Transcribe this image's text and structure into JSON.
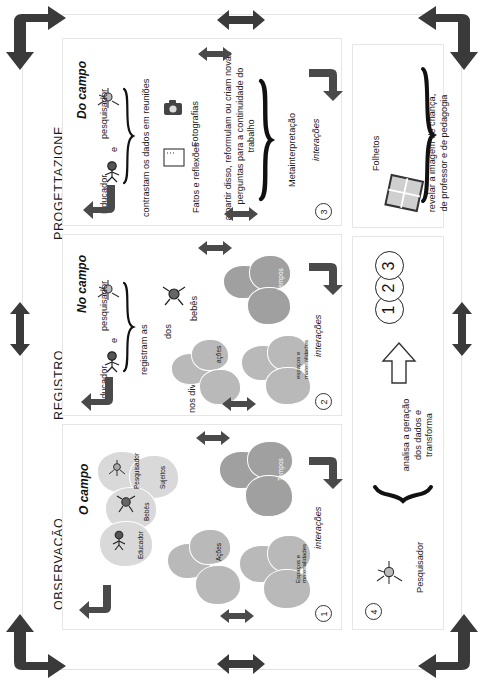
{
  "figure": {
    "orientation": "rotated-90-ccw",
    "background": "#ffffff",
    "accent_dark": "#3a3a3a",
    "bubble_mid": "#b9b9b9",
    "bubble_light": "#d9d9d9",
    "bubble_dark": "#a0a0a0"
  },
  "sections": [
    {
      "id": "observacao",
      "title": "OBSERVAÇÃO",
      "subtitle": "O campo",
      "number": "1"
    },
    {
      "id": "registro",
      "title": "REGISTRO",
      "subtitle": "No campo",
      "number": "2"
    },
    {
      "id": "progettazione",
      "title": "PROGETTAZIONE",
      "subtitle": "Do campo",
      "number": "3"
    }
  ],
  "panel_observacao": {
    "number": "1",
    "interactions_label": "interações",
    "bubbles_subjects": [
      "Pesquisador",
      "Sujeitos",
      "Bebês",
      "Educador"
    ],
    "bubbles_actions": [
      "Ações"
    ],
    "bubbles_times": [
      "Tempos"
    ],
    "bubbles_spaces": [
      "Espaços e materialidades"
    ]
  },
  "panel_registro": {
    "number": "2",
    "actors": [
      "Educador",
      "e",
      "pesquisador"
    ],
    "verb": "registram as",
    "line_1": "dos",
    "line_2": "bebês",
    "line_3": "nos diversos",
    "interactions_label": "interações",
    "bubbles_actions": [
      "ações"
    ],
    "bubbles_times": [
      "Tempos"
    ],
    "bubbles_spaces": [
      "espaços e materialidades"
    ]
  },
  "panel_progettazione": {
    "number": "3",
    "actors": [
      "Educador",
      "e",
      "pesquisador"
    ],
    "verb": "contrastam os dados em reuniões",
    "artifact_photos": "Fotografias",
    "artifact_notes": "Fatos e reflexões",
    "outcome": "a partir disso, reformulam ou criam novas perguntas para a continuidade do trabalho",
    "brace_label": "Metainterpretação",
    "interactions_label": "interações"
  },
  "panel_researcher": {
    "number": "4",
    "actor": "Pesquisador",
    "action": "analisa a geração dos dados e transforma",
    "targets": [
      "1",
      "2",
      "3"
    ]
  },
  "panel_output": {
    "artifact": "Folhetos",
    "purpose": "revelar a imagem de criança, de professor e de pedagogia"
  }
}
